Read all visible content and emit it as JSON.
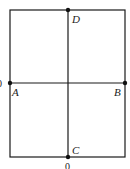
{
  "figure": {
    "type": "rectangle-with-midlines",
    "stroke_color": "#1a1a1a",
    "background": "#ffffff",
    "rectangle": {
      "x1": 10,
      "y1": 10,
      "x2": 125,
      "y2": 157
    },
    "horizontal_line": {
      "from": "A",
      "to": "B"
    },
    "vertical_line": {
      "from": "D",
      "to": "C"
    },
    "points": [
      {
        "label": "A",
        "x": 10,
        "y": 83
      },
      {
        "label": "B",
        "x": 125,
        "y": 83
      },
      {
        "label": "C",
        "x": 68,
        "y": 157
      },
      {
        "label": "D",
        "x": 68,
        "y": 10
      }
    ],
    "labels": {
      "A": "A",
      "B": "B",
      "C": "C",
      "D": "D"
    },
    "edge_marks": {
      "left": "0",
      "bottom": "0"
    }
  }
}
